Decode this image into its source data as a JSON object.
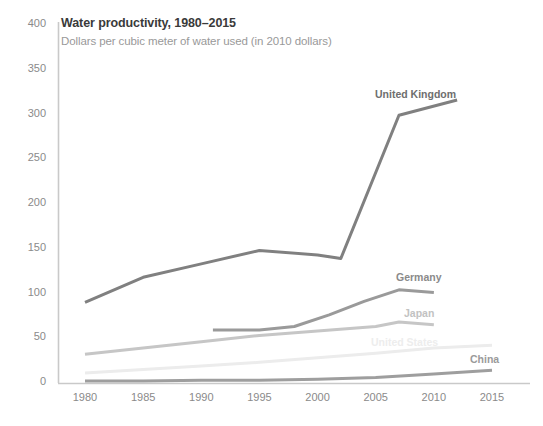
{
  "chart_data": {
    "type": "line",
    "title": "Water productivity, 1980–2015",
    "subtitle": "Dollars per cubic meter of water used (in 2010 dollars)",
    "xlabel": "",
    "ylabel": "",
    "xlim": [
      1980,
      2015
    ],
    "ylim": [
      0,
      400
    ],
    "yticks": [
      0,
      50,
      100,
      150,
      200,
      250,
      300,
      350,
      400
    ],
    "xticks": [
      1980,
      1985,
      1990,
      1995,
      2000,
      2005,
      2010,
      2015
    ],
    "grid": false,
    "legend_position": "inline-end-of-line",
    "series": [
      {
        "name": "United Kingdom",
        "color": "#808080",
        "label_color": "#6e6e6e",
        "x": [
          1980,
          1985,
          1990,
          1995,
          2000,
          2002,
          2007,
          2012
        ],
        "values": [
          89,
          117,
          132,
          147,
          142,
          138,
          298,
          315
        ]
      },
      {
        "name": "Germany",
        "color": "#9a9a9a",
        "label_color": "#8a8a8a",
        "x": [
          1991,
          1995,
          1998,
          2001,
          2004,
          2007,
          2010
        ],
        "values": [
          58,
          58,
          62,
          75,
          90,
          103,
          100
        ]
      },
      {
        "name": "Japan",
        "color": "#c6c6c6",
        "label_color": "#c2c2c2",
        "x": [
          1980,
          1985,
          1990,
          1995,
          2000,
          2005,
          2007,
          2010
        ],
        "values": [
          31,
          38,
          45,
          52,
          57,
          62,
          67,
          64
        ]
      },
      {
        "name": "United States",
        "color": "#ececec",
        "label_color": "#ededed",
        "x": [
          1980,
          1985,
          1990,
          1995,
          2000,
          2005,
          2010,
          2015
        ],
        "values": [
          10,
          14,
          18,
          22,
          27,
          32,
          38,
          41
        ]
      },
      {
        "name": "China",
        "color": "#9e9e9e",
        "label_color": "#9a9a9a",
        "x": [
          1980,
          1985,
          1990,
          1995,
          2000,
          2005,
          2010,
          2015
        ],
        "values": [
          1,
          1,
          2,
          2,
          3,
          5,
          9,
          13
        ]
      }
    ]
  },
  "axis": {
    "y_labels": [
      "400",
      "350",
      "300",
      "250",
      "200",
      "150",
      "100",
      "50",
      "0"
    ],
    "x_labels": [
      "1980",
      "1985",
      "1990",
      "1995",
      "2000",
      "2005",
      "2010",
      "2015"
    ]
  },
  "series_labels": {
    "uk": "United Kingdom",
    "germany": "Germany",
    "japan": "Japan",
    "united_states": "United States",
    "china": "China"
  },
  "colors": {
    "axis_line": "#c9c9c9",
    "tick_text": "#8a8a8a",
    "title_text": "#3a3a3a",
    "subtitle_text": "#999999",
    "background": "#ffffff"
  }
}
